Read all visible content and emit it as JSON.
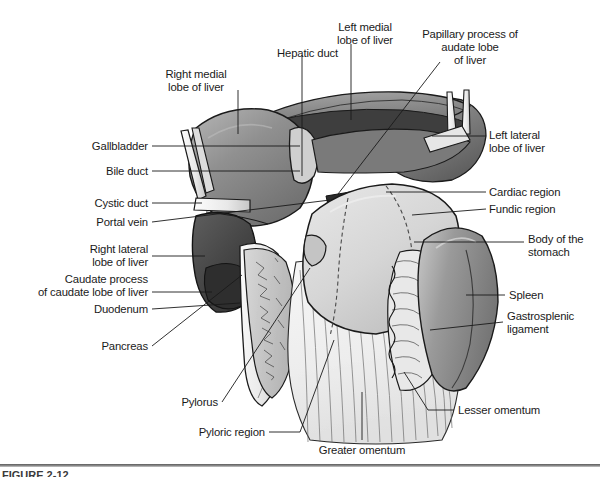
{
  "figure": {
    "caption": "FIGURE 2-12",
    "background_color": "#ffffff",
    "line_color": "#1a1a1a",
    "palette": {
      "liver_light": "#9a9a9a",
      "liver_mid": "#868686",
      "liver_dark": "#4c4c4c",
      "liver_darkest": "#3a3a3a",
      "stomach": "#d2d2d2",
      "stomach_light": "#e2e2e2",
      "spleen": "#9e9e9e",
      "omentum": "#f2f2f2",
      "duct_fill": "#ededed",
      "outline": "#1a1a1a"
    }
  },
  "labels": {
    "right_medial_lobe": {
      "text": "Right medial\nlobe of liver",
      "align": "center",
      "x": 196,
      "y": 68
    },
    "hepatic_duct": {
      "text": "Hepatic duct",
      "align": "right",
      "x": 338,
      "y": 47
    },
    "left_medial_lobe": {
      "text": "Left medial\nlobe of liver",
      "align": "center",
      "x": 365,
      "y": 21
    },
    "papillary_process": {
      "text": "Papillary process of\naudate lobe\nof liver",
      "align": "center",
      "x": 468,
      "y": 28
    },
    "gallbladder": {
      "text": "Gallbladder",
      "align": "right",
      "x": 148,
      "y": 142
    },
    "bile_duct": {
      "text": "Bile duct",
      "align": "right",
      "x": 148,
      "y": 167
    },
    "cystic_duct": {
      "text": "Cystic duct",
      "align": "right",
      "x": 148,
      "y": 199
    },
    "portal_vein": {
      "text": "Portal vein",
      "align": "right",
      "x": 148,
      "y": 219
    },
    "right_lateral_lobe": {
      "text": "Right lateral\nlobe of liver",
      "align": "right",
      "x": 148,
      "y": 245
    },
    "caudate_process": {
      "text": "Caudate process\nof caudate lobe of liver",
      "align": "right",
      "x": 148,
      "y": 278
    },
    "duodenum": {
      "text": "Duodenum",
      "align": "right",
      "x": 148,
      "y": 305
    },
    "pancreas": {
      "text": "Pancreas",
      "align": "right",
      "x": 148,
      "y": 342
    },
    "pylorus": {
      "text": "Pylorus",
      "align": "right",
      "x": 218,
      "y": 398
    },
    "pyloric_region": {
      "text": "Pyloric region",
      "align": "right",
      "x": 265,
      "y": 428
    },
    "greater_omentum": {
      "text": "Greater omentum",
      "align": "center",
      "x": 362,
      "y": 446
    },
    "lesser_omentum": {
      "text": "Lesser omentum",
      "align": "left",
      "x": 458,
      "y": 406
    },
    "left_lateral_lobe": {
      "text": "Left lateral\nlobe of liver",
      "align": "left",
      "x": 489,
      "y": 131
    },
    "cardiac_region": {
      "text": "Cardiac region",
      "align": "left",
      "x": 489,
      "y": 188
    },
    "fundic_region": {
      "text": "Fundic region",
      "align": "left",
      "x": 489,
      "y": 205
    },
    "body_of_stomach": {
      "text": "Body of the\nstomach",
      "align": "left",
      "x": 528,
      "y": 235
    },
    "spleen": {
      "text": "Spleen",
      "align": "left",
      "x": 509,
      "y": 291
    },
    "gastrosplenic": {
      "text": "Gastrosplenic\nligament",
      "align": "left",
      "x": 507,
      "y": 312
    }
  }
}
